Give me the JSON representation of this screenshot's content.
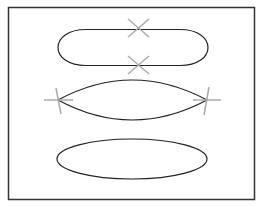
{
  "diagram": {
    "colors": {
      "background": "#ffffff",
      "frame_stroke": "#333333",
      "shape_stroke": "#222222",
      "marker_stroke": "#aaaaaa"
    },
    "frame": {
      "x": 8,
      "y": 7,
      "width": 247,
      "height": 193
    },
    "shapes": [
      {
        "name": "rounded-ellipse-top",
        "kind": "stadium",
        "x": 58,
        "y": 29,
        "width": 150,
        "height": 37
      },
      {
        "name": "lens-middle",
        "kind": "lens",
        "left": [
          58,
          100
        ],
        "right": [
          207,
          100
        ],
        "top_y": 80,
        "bottom_y": 120
      },
      {
        "name": "ellipse-bottom",
        "kind": "ellipse",
        "cx": 132,
        "cy": 159,
        "rx": 75,
        "ry": 20
      }
    ],
    "markers": [
      {
        "name": "x-marker-top",
        "type": "x",
        "cx": 138,
        "cy": 28
      },
      {
        "name": "x-marker-upper-middle",
        "type": "x",
        "cx": 138,
        "cy": 65
      },
      {
        "name": "plus-marker-left",
        "type": "plus",
        "cx": 58,
        "cy": 100
      },
      {
        "name": "plus-marker-right",
        "type": "plus",
        "cx": 207,
        "cy": 100
      }
    ]
  }
}
